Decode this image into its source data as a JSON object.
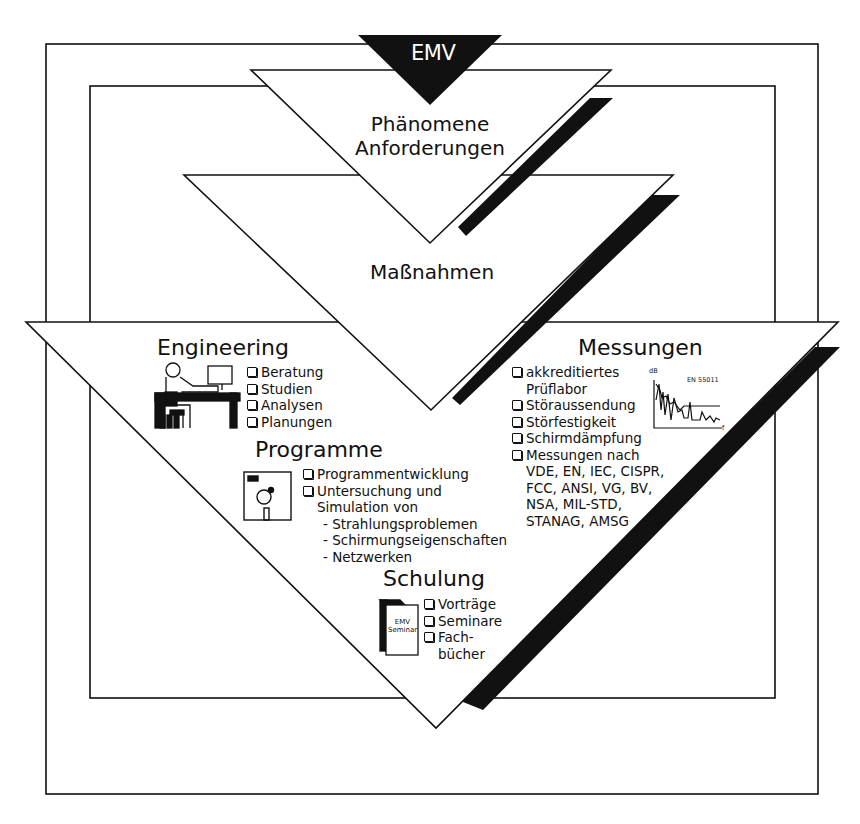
{
  "diagram": {
    "title": "EMV",
    "colors": {
      "ink": "#111111",
      "paper": "#ffffff"
    },
    "levels": [
      {
        "id": "phaenomene",
        "lines": [
          "Phänomene",
          "Anforderungen"
        ]
      },
      {
        "id": "massnahmen",
        "lines": [
          "Maßnahmen"
        ]
      }
    ],
    "engineering": {
      "heading": "Engineering",
      "icon": "engineer-at-desk-icon",
      "items": [
        "Beratung",
        "Studien",
        "Analysen",
        "Planungen"
      ]
    },
    "programme": {
      "heading": "Programme",
      "icon": "floppy-disk-icon",
      "items": [
        {
          "label": "Programmentwicklung"
        },
        {
          "label": "Untersuchung und",
          "continuation": "Simulation von",
          "subitems": [
            "- Strahlungsproblemen",
            "- Schirmungseigenschaften",
            "- Netzwerken"
          ]
        }
      ]
    },
    "messungen": {
      "heading": "Messungen",
      "icon": "spectrum-plot-icon",
      "plot": {
        "y_label": "dB",
        "x_label": "f",
        "standard": "EN 55011"
      },
      "items": [
        {
          "label": "akkreditiertes",
          "continuation": [
            "Prüflabor"
          ]
        },
        {
          "label": "Störaussendung"
        },
        {
          "label": "Störfestigkeit"
        },
        {
          "label": "Schirmdämpfung"
        },
        {
          "label": "Messungen nach",
          "continuation": [
            "VDE, EN, IEC, CISPR,",
            "FCC, ANSI, VG, BV,",
            "NSA, MIL-STD,",
            "STANAG, AMSG"
          ]
        }
      ]
    },
    "schulung": {
      "heading": "Schulung",
      "icon": "seminar-book-icon",
      "book_label": [
        "EMV",
        "Seminar"
      ],
      "items": [
        {
          "label": "Vorträge"
        },
        {
          "label": "Seminare"
        },
        {
          "label": "Fach-",
          "continuation": "bücher"
        }
      ]
    }
  }
}
